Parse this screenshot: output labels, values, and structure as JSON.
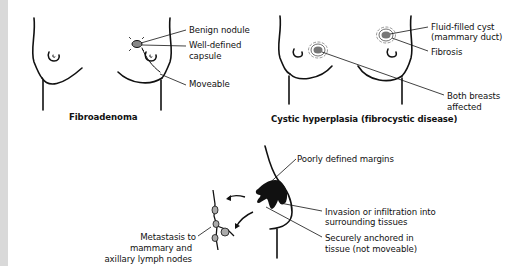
{
  "panels": {
    "fibroadenoma": {
      "caption": "Fibroadenoma",
      "labels": {
        "benign_nodule": "Benign nodule",
        "well_defined_1": "Well-defined",
        "well_defined_2": "capsule",
        "moveable": "Moveable"
      }
    },
    "cystic": {
      "caption": "Cystic hyperplasia (fibrocystic disease)",
      "labels": {
        "cyst_1": "Fluid-filled cyst",
        "cyst_2": "(mammary duct)",
        "fibrosis": "Fibrosis",
        "both_1": "Both breasts",
        "both_2": "affected"
      }
    },
    "malignant": {
      "labels": {
        "poorly_defined": "Poorly defined margins",
        "invasion_1": "Invasion or infiltration into",
        "invasion_2": "surrounding tissues",
        "anchored_1": "Securely anchored in",
        "anchored_2": "tissue (not moveable)",
        "metastasis_1": "Metastasis to",
        "metastasis_2": "mammary and",
        "metastasis_3": "axillary lymph nodes"
      }
    }
  }
}
